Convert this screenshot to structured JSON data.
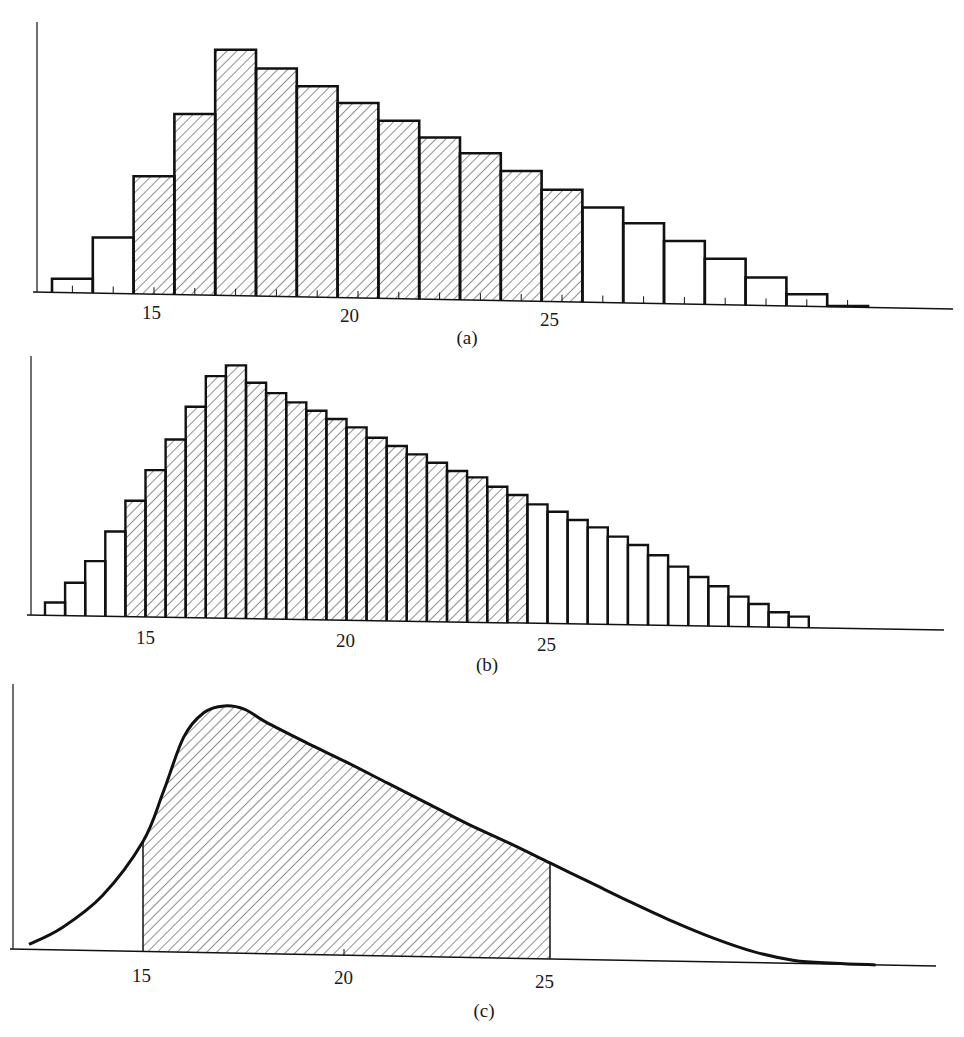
{
  "chart_data": [
    {
      "id": "a",
      "type": "bar",
      "title": "",
      "panel_label": "(a)",
      "xlabel": "",
      "ylabel": "",
      "bin_width": 1,
      "x_start": 12.5,
      "tick_labels": [
        "15",
        "20",
        "25"
      ],
      "tick_values": [
        15,
        20,
        25
      ],
      "shaded_range": [
        14.5,
        25.5
      ],
      "bin_centers": [
        13,
        14,
        15,
        16,
        17,
        18,
        19,
        20,
        21,
        22,
        23,
        24,
        25,
        26,
        27,
        28,
        29,
        30,
        31,
        32
      ],
      "values": [
        14,
        56,
        118,
        181,
        246,
        228,
        211,
        195,
        178,
        162,
        147,
        130,
        112,
        95,
        80,
        63,
        46,
        28,
        12,
        1
      ],
      "shaded": [
        false,
        false,
        true,
        true,
        true,
        true,
        true,
        true,
        true,
        true,
        true,
        true,
        true,
        false,
        false,
        false,
        false,
        false,
        false,
        false
      ],
      "grid": false,
      "legend": null
    },
    {
      "id": "b",
      "type": "bar",
      "title": "",
      "panel_label": "(b)",
      "xlabel": "",
      "ylabel": "",
      "bin_width": 0.5,
      "x_start": 12.75,
      "tick_labels": [
        "15",
        "20",
        "25"
      ],
      "tick_values": [
        15,
        20,
        25
      ],
      "shaded_range": [
        14.75,
        24.75
      ],
      "values": [
        13,
        33,
        55,
        85,
        116,
        147,
        178,
        211,
        242,
        253,
        236,
        226,
        217,
        209,
        201,
        193,
        183,
        175,
        167,
        159,
        151,
        145,
        136,
        128,
        119,
        112,
        104,
        97,
        88,
        80,
        70,
        59,
        49,
        40,
        30,
        23,
        15,
        11
      ],
      "shaded_from_index": 4,
      "shaded_to_index": 23,
      "grid": false,
      "legend": null
    },
    {
      "id": "c",
      "type": "area",
      "title": "",
      "panel_label": "(c)",
      "xlabel": "",
      "ylabel": "",
      "tick_labels": [
        "15",
        "20",
        "25"
      ],
      "tick_values": [
        15,
        20,
        25
      ],
      "shaded_range": [
        15,
        25
      ],
      "x": [
        12.2,
        13,
        14,
        15,
        15.5,
        16,
        16.5,
        17,
        17.5,
        18,
        19,
        20,
        21,
        22,
        23,
        24,
        25,
        26,
        27,
        28,
        29,
        30,
        31,
        32,
        33
      ],
      "y": [
        5,
        22,
        55,
        110,
        160,
        215,
        240,
        247,
        244,
        232,
        212,
        193,
        173,
        153,
        133,
        115,
        96,
        77,
        58,
        40,
        24,
        11,
        3,
        1,
        0
      ],
      "grid": false,
      "legend": null
    }
  ]
}
